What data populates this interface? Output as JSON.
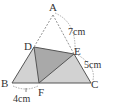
{
  "diagram": {
    "type": "geometry-triangle",
    "points": {
      "A": {
        "label": "A",
        "x": 53,
        "y": 15
      },
      "B": {
        "label": "B",
        "x": 12,
        "y": 83
      },
      "C": {
        "label": "C",
        "x": 91,
        "y": 83
      },
      "D": {
        "label": "D",
        "x": 34,
        "y": 47
      },
      "E": {
        "label": "E",
        "x": 74,
        "y": 54
      },
      "F": {
        "label": "F",
        "x": 39,
        "y": 83
      }
    },
    "measurements": {
      "AE": "7cm",
      "EC": "5cm",
      "BF": "4cm"
    },
    "colors": {
      "outer_fill": "#d2d2d2",
      "inner_fill": "#a9a9a9",
      "stroke": "#555555",
      "dashed": "#777777"
    }
  }
}
